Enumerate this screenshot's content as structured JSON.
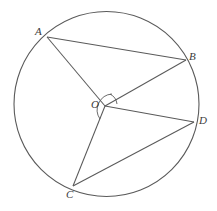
{
  "figure": {
    "type": "circle-geometry-diagram",
    "background_color": "#ffffff",
    "stroke_color": "#5a5a5a",
    "label_color": "#3b3b3b",
    "circle": {
      "name": "main-circle",
      "center_x": 106.5,
      "center_y": 104,
      "radius": 92.5
    },
    "points": [
      {
        "id": "A",
        "label": "A",
        "x": 47,
        "y": 37,
        "label_x": 35,
        "label_y": 26,
        "on_circle": true
      },
      {
        "id": "B",
        "label": "B",
        "x": 186,
        "y": 60,
        "label_x": 189,
        "label_y": 51,
        "on_circle": true
      },
      {
        "id": "C",
        "label": "C",
        "x": 73,
        "y": 186,
        "label_x": 66,
        "label_y": 189,
        "on_circle": true
      },
      {
        "id": "D",
        "label": "D",
        "x": 194,
        "y": 122,
        "label_x": 199,
        "label_y": 115,
        "on_circle": true
      },
      {
        "id": "O",
        "label": "O",
        "x": 105,
        "y": 106,
        "label_x": 91,
        "label_y": 99,
        "on_circle": false
      }
    ],
    "segments": [
      {
        "name": "segment-AB",
        "from": "A",
        "to": "B"
      },
      {
        "name": "segment-AO",
        "from": "A",
        "to": "O"
      },
      {
        "name": "segment-OB",
        "from": "O",
        "to": "B"
      },
      {
        "name": "segment-OD",
        "from": "O",
        "to": "D"
      },
      {
        "name": "segment-OC",
        "from": "O",
        "to": "C"
      },
      {
        "name": "segment-CD",
        "from": "C",
        "to": "D"
      }
    ],
    "angle_arcs": [
      {
        "name": "angle-arc-AOB",
        "at": "O",
        "path": "M 110 94 A 13 13 0 0 1 117 104"
      },
      {
        "name": "angle-arc-COD",
        "at": "O",
        "path": "M 112 94 A 16 16 0 0 0 100 119"
      }
    ]
  }
}
